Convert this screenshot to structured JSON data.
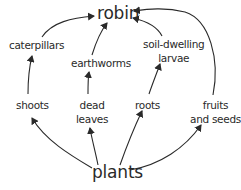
{
  "diagram": {
    "type": "food web",
    "colors": {
      "ink": "#2a2a2a",
      "background": "#ffffff"
    },
    "nodes": {
      "robin": {
        "lines": [
          "robin"
        ]
      },
      "caterpillars": {
        "lines": [
          "caterpillars"
        ]
      },
      "earthworms": {
        "lines": [
          "earthworms"
        ]
      },
      "larvae": {
        "lines": [
          "soil-dwelling",
          "larvae"
        ]
      },
      "shoots": {
        "lines": [
          "shoots"
        ]
      },
      "dead_leaves": {
        "lines": [
          "dead",
          "leaves"
        ]
      },
      "roots": {
        "lines": [
          "roots"
        ]
      },
      "fruits_seeds": {
        "lines": [
          "fruits",
          "and seeds"
        ]
      },
      "plants": {
        "lines": [
          "plants"
        ]
      }
    },
    "edges": [
      {
        "from": "plants",
        "to": "shoots"
      },
      {
        "from": "plants",
        "to": "dead leaves"
      },
      {
        "from": "plants",
        "to": "roots"
      },
      {
        "from": "plants",
        "to": "fruits and seeds"
      },
      {
        "from": "shoots",
        "to": "caterpillars"
      },
      {
        "from": "dead leaves",
        "to": "earthworms"
      },
      {
        "from": "roots",
        "to": "soil-dwelling larvae"
      },
      {
        "from": "caterpillars",
        "to": "robin"
      },
      {
        "from": "earthworms",
        "to": "robin"
      },
      {
        "from": "soil-dwelling larvae",
        "to": "robin"
      },
      {
        "from": "fruits and seeds",
        "to": "robin"
      }
    ]
  }
}
